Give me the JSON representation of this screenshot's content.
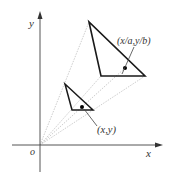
{
  "figure": {
    "axes": {
      "x_label": "x",
      "y_label": "y",
      "origin_label": "o"
    },
    "labels": {
      "small_point": "(x,y)",
      "large_point": "(x/a,y/b)"
    },
    "colors": {
      "axis": "#555555",
      "triangle": "#1a1a1a",
      "projection_lines": "#b5b5b5",
      "leader": "#444444"
    }
  }
}
